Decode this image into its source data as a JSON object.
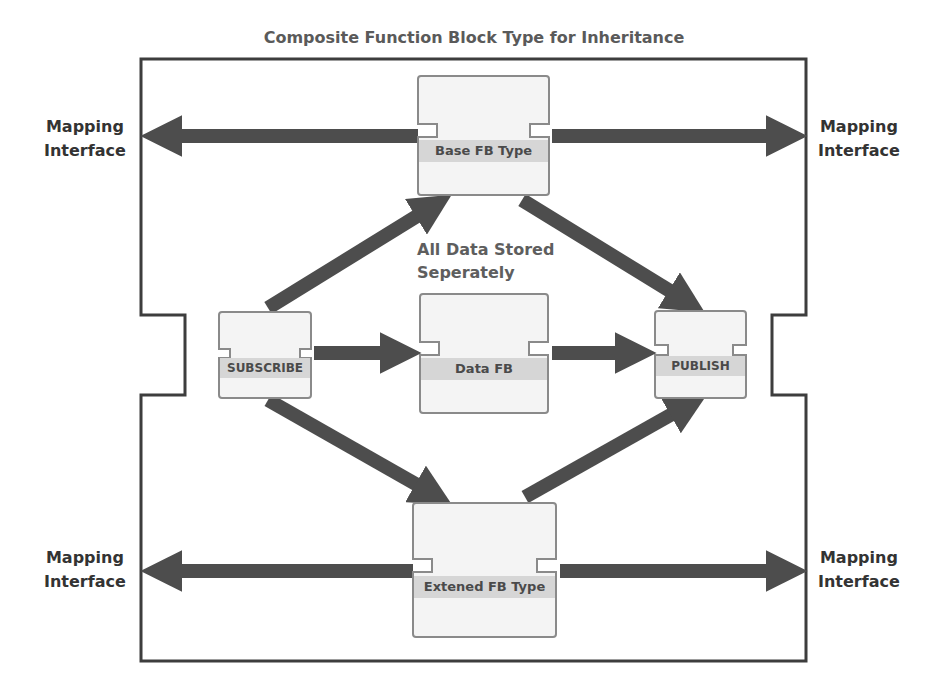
{
  "title": "Composite Function Block Type for Inheritance",
  "note": {
    "line1": "All Data Stored",
    "line2": "Seperately"
  },
  "blocks": {
    "base": {
      "label": "Base FB Type"
    },
    "subscribe": {
      "label": "SUBSCRIBE"
    },
    "data": {
      "label": "Data FB"
    },
    "publish": {
      "label": "PUBLISH"
    },
    "extended": {
      "label": "Extened FB Type"
    }
  },
  "mapping": {
    "top_left": {
      "line1": "Mapping",
      "line2": "Interface"
    },
    "top_right": {
      "line1": "Mapping",
      "line2": "Interface"
    },
    "bottom_left": {
      "line1": "Mapping",
      "line2": "Interface"
    },
    "bottom_right": {
      "line1": "Mapping",
      "line2": "Interface"
    }
  },
  "colors": {
    "arrow": "#4d4d4d",
    "border": "#3d3d3d",
    "block_fill": "#f4f4f4",
    "label_band": "#d6d6d6"
  }
}
